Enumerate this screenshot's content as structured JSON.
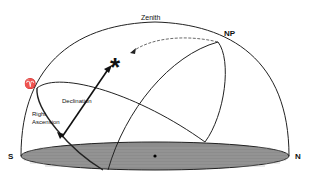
{
  "diagram": {
    "labels": {
      "zenith": "Zenith",
      "north_pole": "NP",
      "south": "S",
      "north": "N",
      "vernal_equinox": "♈",
      "declination": "Declination",
      "right_ascension_line1": "Right",
      "right_ascension_line2": "Ascension",
      "star": "*"
    },
    "colors": {
      "lines": "#1a1a1a",
      "horizon_disk": "#8c8c8c",
      "background": "#ffffff"
    }
  }
}
